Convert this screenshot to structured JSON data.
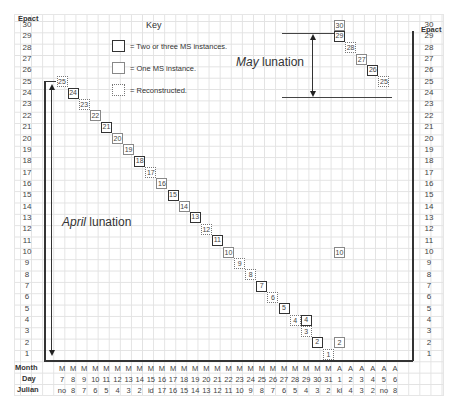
{
  "axis": {
    "left_title": "Epact",
    "right_title": "Epact",
    "epacts": [
      30,
      29,
      28,
      27,
      26,
      25,
      24,
      23,
      22,
      21,
      20,
      19,
      18,
      17,
      16,
      15,
      14,
      13,
      12,
      11,
      10,
      9,
      8,
      7,
      6,
      5,
      4,
      3,
      2,
      1
    ]
  },
  "key": {
    "title": "Key",
    "items": [
      {
        "style": "thick",
        "label": "= Two or three MS instances."
      },
      {
        "style": "thin",
        "label": "= One MS instance."
      },
      {
        "style": "dotted",
        "label": "= Reconstructed."
      }
    ]
  },
  "annotations": {
    "april_italic": "April",
    "april_rest": " lunation",
    "may_italic": "May",
    "may_rest": " lunation"
  },
  "table": {
    "row_labels": {
      "month": "Month",
      "day": "Day",
      "julian": "Julian"
    },
    "months": [
      "M",
      "M",
      "M",
      "M",
      "M",
      "M",
      "M",
      "M",
      "M",
      "M",
      "M",
      "M",
      "M",
      "M",
      "M",
      "M",
      "M",
      "M",
      "M",
      "M",
      "M",
      "M",
      "M",
      "M",
      "M",
      "A",
      "A",
      "A",
      "A",
      "A",
      "A"
    ],
    "days": [
      "7",
      "8",
      "9",
      "10",
      "11",
      "12",
      "13",
      "14",
      "15",
      "16",
      "17",
      "18",
      "19",
      "20",
      "21",
      "22",
      "23",
      "24",
      "25",
      "26",
      "27",
      "28",
      "29",
      "30",
      "31",
      "1",
      "2",
      "3",
      "4",
      "5",
      "6"
    ],
    "julian": [
      "no",
      "8",
      "7",
      "6",
      "5",
      "4",
      "3",
      "2",
      "id",
      "17",
      "16",
      "15",
      "14",
      "13",
      "12",
      "11",
      "10",
      "9",
      "8",
      "7",
      "6",
      "5",
      "4",
      "3",
      "2",
      "kl",
      "4",
      "3",
      "2",
      "no",
      "8"
    ]
  },
  "chart_data": {
    "type": "scatter",
    "xlabel": "Day (Month / Day / Julian)",
    "ylabel": "Epact",
    "ylim": [
      1,
      30
    ],
    "legend": [
      "Two or three MS instances (thick box)",
      "One MS instance (thin box)",
      "Reconstructed (dotted box)"
    ],
    "points": [
      {
        "col": 0,
        "epact": 25,
        "style": "dotted"
      },
      {
        "col": 1,
        "epact": 24,
        "style": "thick"
      },
      {
        "col": 2,
        "epact": 23,
        "style": "dotted"
      },
      {
        "col": 3,
        "epact": 22,
        "style": "thin"
      },
      {
        "col": 4,
        "epact": 21,
        "style": "thick"
      },
      {
        "col": 5,
        "epact": 20,
        "style": "thin"
      },
      {
        "col": 6,
        "epact": 19,
        "style": "thin"
      },
      {
        "col": 7,
        "epact": 18,
        "style": "thick"
      },
      {
        "col": 8,
        "epact": 17,
        "style": "dotted"
      },
      {
        "col": 9,
        "epact": 16,
        "style": "thin"
      },
      {
        "col": 10,
        "epact": 15,
        "style": "thick"
      },
      {
        "col": 11,
        "epact": 14,
        "style": "thin"
      },
      {
        "col": 12,
        "epact": 13,
        "style": "thick"
      },
      {
        "col": 13,
        "epact": 12,
        "style": "dotted"
      },
      {
        "col": 14,
        "epact": 11,
        "style": "thick"
      },
      {
        "col": 15,
        "epact": 10,
        "style": "thin"
      },
      {
        "col": 16,
        "epact": 9,
        "style": "dotted"
      },
      {
        "col": 17,
        "epact": 8,
        "style": "dotted"
      },
      {
        "col": 18,
        "epact": 7,
        "style": "thick"
      },
      {
        "col": 19,
        "epact": 6,
        "style": "dotted"
      },
      {
        "col": 20,
        "epact": 5,
        "style": "thick"
      },
      {
        "col": 21,
        "epact": 4,
        "style": "dotted"
      },
      {
        "col": 22,
        "epact": 4,
        "style": "thick"
      },
      {
        "col": 22,
        "epact": 3,
        "style": "dotted"
      },
      {
        "col": 23,
        "epact": 2,
        "style": "thick"
      },
      {
        "col": 24,
        "epact": 1,
        "style": "dotted"
      },
      {
        "col": 25,
        "epact": 2,
        "style": "thin"
      },
      {
        "col": 25,
        "epact": 10,
        "style": "thin"
      },
      {
        "col": 25,
        "epact": 30,
        "style": "thin"
      },
      {
        "col": 25,
        "epact": 29,
        "style": "thick"
      },
      {
        "col": 26,
        "epact": 28,
        "style": "dotted"
      },
      {
        "col": 27,
        "epact": 27,
        "style": "thin"
      },
      {
        "col": 28,
        "epact": 26,
        "style": "thick"
      },
      {
        "col": 29,
        "epact": 25,
        "style": "dotted"
      }
    ]
  }
}
